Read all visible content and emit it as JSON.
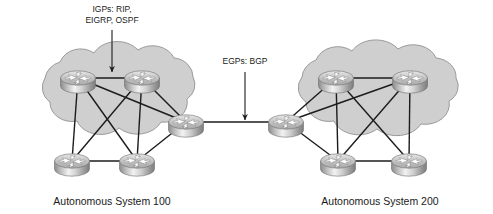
{
  "diagram": {
    "background_color": "#ffffff",
    "cloud_fill": "#cfcfcf",
    "cloud_stroke": "#9a9a9a",
    "link_color": "#1c1c1c",
    "annotations": [
      {
        "id": "igp",
        "line1": "IGPs: RIP,",
        "line2": "EIGRP, OSPF",
        "text_x": 112,
        "text_y": 12,
        "arrow_from_x": 112,
        "arrow_from_y": 30,
        "arrow_to_x": 112,
        "arrow_to_y": 72
      },
      {
        "id": "egp",
        "line1": "EGPs: BGP",
        "line2": "",
        "text_x": 245,
        "text_y": 64,
        "arrow_from_x": 245,
        "arrow_from_y": 72,
        "arrow_to_x": 245,
        "arrow_to_y": 120
      }
    ],
    "clouds": [
      {
        "id": "as100",
        "caption": "Autonomous System 100",
        "caption_x": 112,
        "caption_y": 205,
        "center_x": 110,
        "center_y": 122
      },
      {
        "id": "as200",
        "caption": "Autonomous System 200",
        "caption_x": 380,
        "caption_y": 205,
        "center_x": 378,
        "center_y": 122
      }
    ],
    "routers": [
      {
        "id": "r1",
        "as": "as100",
        "x": 78,
        "y": 78,
        "role": "internal"
      },
      {
        "id": "r2",
        "as": "as100",
        "x": 142,
        "y": 78,
        "role": "internal"
      },
      {
        "id": "r3",
        "as": "as100",
        "x": 186,
        "y": 122,
        "role": "border"
      },
      {
        "id": "r4",
        "as": "as100",
        "x": 72,
        "y": 161,
        "role": "internal"
      },
      {
        "id": "r5",
        "as": "as100",
        "x": 137,
        "y": 161,
        "role": "internal"
      },
      {
        "id": "r6",
        "as": "as200",
        "x": 286,
        "y": 122,
        "role": "border"
      },
      {
        "id": "r7",
        "as": "as200",
        "x": 336,
        "y": 78,
        "role": "internal"
      },
      {
        "id": "r8",
        "as": "as200",
        "x": 410,
        "y": 78,
        "role": "internal"
      },
      {
        "id": "r9",
        "as": "as200",
        "x": 338,
        "y": 161,
        "role": "internal"
      },
      {
        "id": "r10",
        "as": "as200",
        "x": 409,
        "y": 161,
        "role": "internal"
      }
    ],
    "links": [
      {
        "from": "r1",
        "to": "r2",
        "kind": "igp"
      },
      {
        "from": "r1",
        "to": "r4",
        "kind": "igp"
      },
      {
        "from": "r1",
        "to": "r5",
        "kind": "igp"
      },
      {
        "from": "r1",
        "to": "r3",
        "kind": "igp"
      },
      {
        "from": "r2",
        "to": "r3",
        "kind": "igp"
      },
      {
        "from": "r2",
        "to": "r4",
        "kind": "igp"
      },
      {
        "from": "r2",
        "to": "r5",
        "kind": "igp"
      },
      {
        "from": "r4",
        "to": "r5",
        "kind": "igp"
      },
      {
        "from": "r5",
        "to": "r3",
        "kind": "igp"
      },
      {
        "from": "r3",
        "to": "r6",
        "kind": "egp"
      },
      {
        "from": "r6",
        "to": "r7",
        "kind": "igp"
      },
      {
        "from": "r6",
        "to": "r8",
        "kind": "igp"
      },
      {
        "from": "r6",
        "to": "r9",
        "kind": "igp"
      },
      {
        "from": "r7",
        "to": "r8",
        "kind": "igp"
      },
      {
        "from": "r7",
        "to": "r9",
        "kind": "igp"
      },
      {
        "from": "r7",
        "to": "r10",
        "kind": "igp"
      },
      {
        "from": "r8",
        "to": "r9",
        "kind": "igp"
      },
      {
        "from": "r8",
        "to": "r10",
        "kind": "igp"
      },
      {
        "from": "r9",
        "to": "r10",
        "kind": "igp"
      }
    ]
  }
}
